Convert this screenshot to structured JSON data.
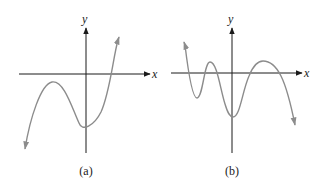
{
  "figure": {
    "panels": [
      {
        "id": "a",
        "caption": "(a)",
        "x_axis_label": "x",
        "y_axis_label": "y",
        "description": "Cubic-like curve: rises from lower left to a local maximum below the x-axis, dips to a minimum on the y-axis, then rises crossing the x-axis once"
      },
      {
        "id": "b",
        "caption": "(b)",
        "x_axis_label": "x",
        "y_axis_label": "y",
        "description": "Oscillating curve with multiple turning points crossing the x-axis several times, ending downward to the right"
      }
    ],
    "colors": {
      "axis": "#1a1a1a",
      "curve": "#8c8c8c",
      "background": "#ffffff"
    }
  }
}
